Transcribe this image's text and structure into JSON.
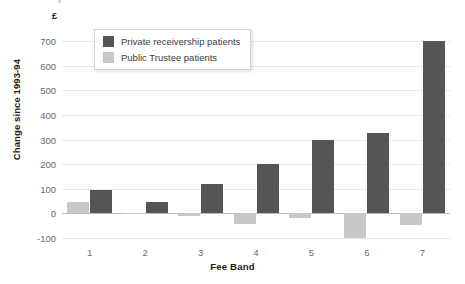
{
  "chart_data": {
    "type": "bar",
    "title": "",
    "subtitle": "",
    "xlabel": "Fee Band",
    "ylabel": "Change since 1993-94",
    "unit_symbol": "£",
    "categories": [
      "1",
      "2",
      "3",
      "4",
      "5",
      "6",
      "7"
    ],
    "series": [
      {
        "name": "Private receivership patients",
        "color": "#555555",
        "values": [
          95,
          48,
          120,
          200,
          300,
          325,
          700
        ]
      },
      {
        "name": "Public Trustee patients",
        "color": "#c8c8c8",
        "values": [
          48,
          -3,
          -10,
          -45,
          -20,
          -98,
          -48
        ]
      }
    ],
    "ylim": [
      -100,
      700
    ],
    "yticks": [
      700,
      600,
      500,
      400,
      300,
      200,
      100,
      0,
      -100
    ],
    "ytick_labels": [
      "700",
      "600",
      "500",
      "400",
      "300",
      "200",
      "100",
      "0",
      "-100"
    ],
    "grid": true,
    "legend_position": "top-left"
  },
  "legend": {
    "items": [
      {
        "label": "Private receivership patients",
        "color": "#555555"
      },
      {
        "label": "Public Trustee patients",
        "color": "#c8c8c8"
      }
    ]
  }
}
